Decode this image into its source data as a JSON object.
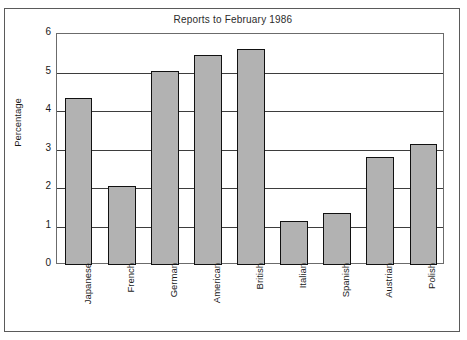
{
  "chart_data": {
    "type": "bar",
    "title": "Reports to February 1986",
    "xlabel": "",
    "ylabel": "Percentage",
    "ylim": [
      0,
      6
    ],
    "yticks": [
      0,
      1,
      2,
      3,
      4,
      5,
      6
    ],
    "grid": true,
    "legend": false,
    "categories": [
      "Japanese",
      "French",
      "German",
      "American",
      "British",
      "Italian",
      "Spanish",
      "Austrian",
      "Polish"
    ],
    "values": [
      4.35,
      2.05,
      5.05,
      5.45,
      5.6,
      1.15,
      1.35,
      2.8,
      3.15
    ],
    "bar_color": "#b2b2b2",
    "bar_border_color": "#111111",
    "frame_color": "#5a5a5a",
    "text_color": "#1a1a1a"
  }
}
